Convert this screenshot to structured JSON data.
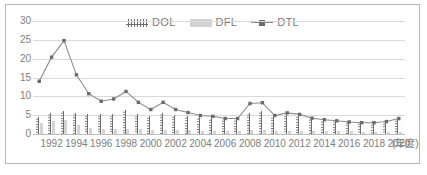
{
  "chart_data": {
    "type": "bar",
    "title": "",
    "xlabel": "(年度)",
    "ylabel": "",
    "ylim": [
      0,
      30
    ],
    "yticks": [
      0,
      5,
      10,
      15,
      20,
      25,
      30
    ],
    "grid": true,
    "legend_position": "top-center",
    "x": [
      1991,
      1992,
      1993,
      1994,
      1995,
      1996,
      1997,
      1998,
      1999,
      2000,
      2001,
      2002,
      2003,
      2004,
      2005,
      2006,
      2007,
      2008,
      2009,
      2010,
      2011,
      2012,
      2013,
      2014,
      2015,
      2016,
      2017,
      2018,
      2019,
      2020
    ],
    "tick_labels": [
      "",
      "1992",
      "",
      "1994",
      "",
      "1996",
      "",
      "1998",
      "",
      "2000",
      "",
      "2002",
      "",
      "2004",
      "",
      "2006",
      "",
      "2008",
      "",
      "2010",
      "",
      "2012",
      "",
      "2014",
      "",
      "2016",
      "",
      "2018",
      "",
      "2020"
    ],
    "series": [
      {
        "name": "DOL",
        "type": "bar",
        "color": "#6e6e6e",
        "pattern": "dotted-hatch",
        "values": [
          4.6,
          5.6,
          6.2,
          5.7,
          5.3,
          5.2,
          5.4,
          6.3,
          5.3,
          4.7,
          5.6,
          5.1,
          4.7,
          4.5,
          4.3,
          4.0,
          3.9,
          5.7,
          6.0,
          4.7,
          5.3,
          5.0,
          4.2,
          3.8,
          3.6,
          3.4,
          3.2,
          3.0,
          3.3,
          4.0
        ]
      },
      {
        "name": "DFL",
        "type": "bar",
        "color": "#d4d4d4",
        "values": [
          3.0,
          3.4,
          3.6,
          2.4,
          1.7,
          1.4,
          1.4,
          1.4,
          1.3,
          1.1,
          1.1,
          1.0,
          1.0,
          0.9,
          0.9,
          0.9,
          0.9,
          1.0,
          1.1,
          0.9,
          0.9,
          0.9,
          0.8,
          0.7,
          0.7,
          0.7,
          0.6,
          0.6,
          0.6,
          0.6
        ]
      },
      {
        "name": "DTL",
        "type": "line",
        "color": "#8c8c8c",
        "marker": "square",
        "values": [
          14.0,
          20.4,
          24.8,
          15.7,
          10.7,
          8.7,
          9.3,
          11.3,
          8.4,
          6.5,
          8.4,
          6.5,
          5.7,
          4.9,
          4.7,
          4.1,
          4.1,
          8.1,
          8.3,
          4.9,
          5.6,
          5.2,
          4.2,
          3.8,
          3.5,
          3.2,
          3.0,
          3.0,
          3.3,
          4.1
        ]
      }
    ]
  },
  "legend": {
    "items": [
      {
        "label": "DOL",
        "swatch": "dol-swatch-icon"
      },
      {
        "label": "DFL",
        "swatch": "dfl-swatch-icon"
      },
      {
        "label": "DTL",
        "swatch": "dtl-line-marker-icon"
      }
    ]
  }
}
